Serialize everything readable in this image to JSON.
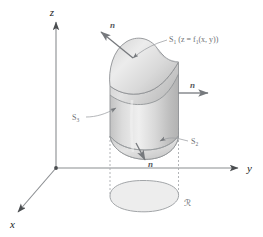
{
  "figure": {
    "background_color": "#ffffff"
  },
  "axes": {
    "z_label": "z",
    "y_label": "y",
    "x_label": "x",
    "color": "#8a8d90",
    "origin_marker": "dot"
  },
  "normals": {
    "top_label": "n",
    "side_label": "n",
    "bottom_label": "n",
    "arrow_color": "#76797d"
  },
  "surfaces": {
    "s1": {
      "name": "S",
      "subscript": "1",
      "equation_open": "(z = f",
      "equation_sub": "1",
      "equation_close": "(x, y))",
      "full_text": "S1 (z = f1(x, y))"
    },
    "s2": {
      "name": "S",
      "subscript": "2",
      "full_text": "S2"
    },
    "s3": {
      "name": "S",
      "subscript": "3",
      "full_text": "S3"
    },
    "leader_color": "#9b9ea1",
    "fill_light": "#e8e8e8",
    "fill_mid": "#d2d2d2",
    "fill_dark": "#b9b9b9",
    "stroke": "#8e9194"
  },
  "region": {
    "label": "ℛ",
    "label_plain": "R",
    "fill": "#ededed",
    "stroke": "#a2a5a8"
  },
  "projection": {
    "dash_color": "#aaadb0",
    "dash_pattern": "2,2"
  }
}
